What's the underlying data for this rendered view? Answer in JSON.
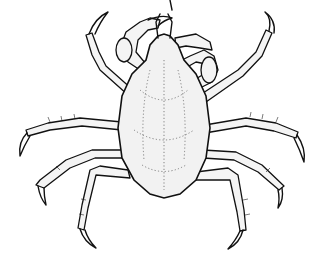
{
  "image": {
    "subject": "crab line drawing",
    "background": "#ffffff",
    "line_color": "#111111",
    "parts": [
      "carapace",
      "left-cheliped",
      "right-cheliped",
      "walking-legs",
      "rostrum"
    ]
  }
}
